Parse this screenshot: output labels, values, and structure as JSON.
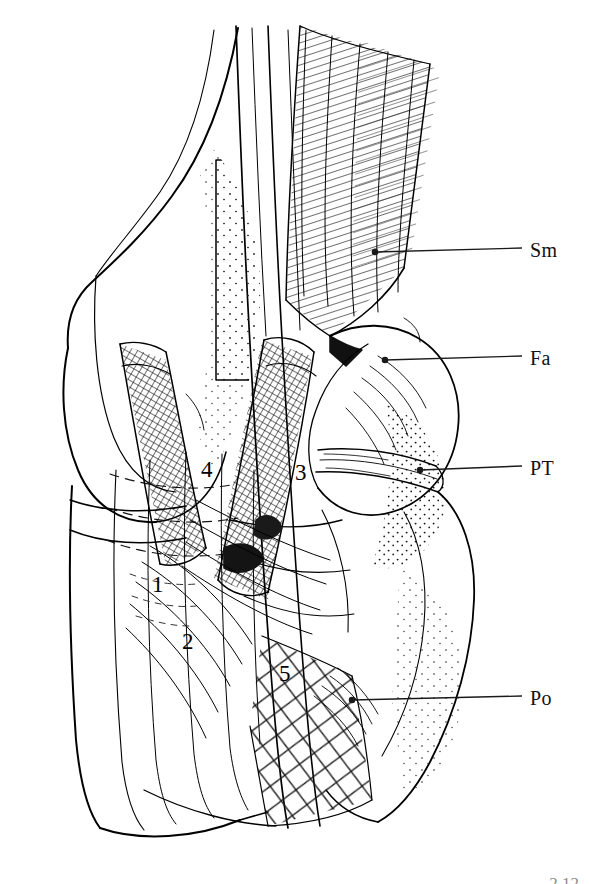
{
  "figure": {
    "background_color": "#ffffff",
    "ink_color": "#000000",
    "corner_mark": "2.12"
  },
  "callout_labels": [
    {
      "id": "sm",
      "text": "Sm",
      "meaning": "Semimembranosus",
      "label_x": 530,
      "label_y": 240,
      "leader": {
        "x1": 375,
        "y1": 252,
        "x2": 522,
        "y2": 248,
        "dot": true,
        "dot_x": 375,
        "dot_y": 252
      }
    },
    {
      "id": "fa",
      "text": "Fa",
      "meaning": "Fascia",
      "label_x": 530,
      "label_y": 348,
      "leader": {
        "x1": 385,
        "y1": 360,
        "x2": 522,
        "y2": 356,
        "dot": true,
        "dot_x": 385,
        "dot_y": 360
      }
    },
    {
      "id": "pt",
      "text": "PT",
      "meaning": "Popliteal tendon",
      "label_x": 530,
      "label_y": 458,
      "leader": {
        "x1": 420,
        "y1": 470,
        "x2": 522,
        "y2": 466,
        "dot": true,
        "dot_x": 420,
        "dot_y": 470
      }
    },
    {
      "id": "po",
      "text": "Po",
      "meaning": "Popliteus",
      "label_x": 530,
      "label_y": 688,
      "leader": {
        "x1": 352,
        "y1": 700,
        "x2": 522,
        "y2": 696,
        "dot": true,
        "dot_x": 352,
        "dot_y": 700
      }
    }
  ],
  "numbered_structures": [
    {
      "id": "1",
      "text": "1",
      "x": 152,
      "y": 573
    },
    {
      "id": "2",
      "text": "2",
      "x": 182,
      "y": 630
    },
    {
      "id": "3",
      "text": "3",
      "x": 295,
      "y": 461
    },
    {
      "id": "4",
      "text": "4",
      "x": 201,
      "y": 458
    },
    {
      "id": "5",
      "text": "5",
      "x": 279,
      "y": 662
    }
  ]
}
